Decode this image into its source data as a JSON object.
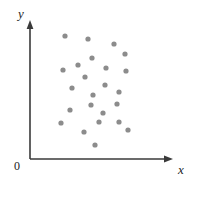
{
  "chart_data": {
    "type": "scatter",
    "title": "",
    "subtitle": "",
    "xlabel": "x",
    "ylabel": "y",
    "origin_label": "0",
    "grid": false,
    "legend": null,
    "axis_ticks": [],
    "tick_labels": [],
    "xlim": [
      0,
      100
    ],
    "ylim": [
      0,
      100
    ],
    "marker": {
      "shape": "circle",
      "color": "#8c8c8c",
      "radius_px": 2.6
    },
    "axis_color": "#3a3a3a",
    "background_color": "#ffffff",
    "point_count": 24,
    "points": [
      {
        "px": 65,
        "py": 36
      },
      {
        "px": 88,
        "py": 39
      },
      {
        "px": 114,
        "py": 44
      },
      {
        "px": 92,
        "py": 58
      },
      {
        "px": 125,
        "py": 54
      },
      {
        "px": 78,
        "py": 65
      },
      {
        "px": 63,
        "py": 70
      },
      {
        "px": 106,
        "py": 68
      },
      {
        "px": 126,
        "py": 71
      },
      {
        "px": 85,
        "py": 77
      },
      {
        "px": 105,
        "py": 85
      },
      {
        "px": 72,
        "py": 88
      },
      {
        "px": 119,
        "py": 92
      },
      {
        "px": 93,
        "py": 95
      },
      {
        "px": 70,
        "py": 110
      },
      {
        "px": 91,
        "py": 105
      },
      {
        "px": 117,
        "py": 104
      },
      {
        "px": 103,
        "py": 113
      },
      {
        "px": 99,
        "py": 122
      },
      {
        "px": 119,
        "py": 122
      },
      {
        "px": 61,
        "py": 123
      },
      {
        "px": 128,
        "py": 130
      },
      {
        "px": 84,
        "py": 132
      },
      {
        "px": 95,
        "py": 145
      }
    ],
    "axes_geometry": {
      "y_axis_x": 30,
      "y_axis_top": 22,
      "x_axis_y": 159,
      "x_axis_right": 173
    }
  }
}
